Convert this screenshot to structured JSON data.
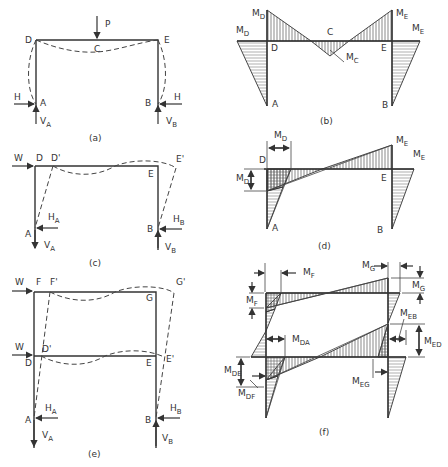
{
  "figure": {
    "panels": [
      {
        "id": "a",
        "caption": "(a)",
        "description": "Portal frame with vertical point load P at mid-span C, fixed bases A and B with horizontal reactions H and vertical reactions VA, VB; dashed deflected shape",
        "labels": {
          "D": "D",
          "E": "E",
          "C": "C",
          "A": "A",
          "B": "B",
          "P": "P",
          "H_left": "H",
          "H_right": "H",
          "VA": "V",
          "VA_sub": "A",
          "VB": "V",
          "VB_sub": "B"
        }
      },
      {
        "id": "b",
        "caption": "(b)",
        "description": "Bending moment diagram for panel (a)",
        "labels": {
          "MD_top": "M",
          "MD_top_sub": "D",
          "MD_left": "M",
          "MD_left_sub": "D",
          "ME_top": "M",
          "ME_top_sub": "E",
          "ME_right": "M",
          "ME_right_sub": "E",
          "C": "C",
          "MC": "M",
          "MC_sub": "C",
          "D": "D",
          "E": "E",
          "A": "A",
          "B": "B"
        }
      },
      {
        "id": "c",
        "caption": "(c)",
        "description": "Portal frame under lateral load W at D; sway deflection to D', E'",
        "labels": {
          "W": "W",
          "D": "D",
          "D_prime": "D'",
          "E": "E",
          "E_prime": "E'",
          "A": "A",
          "B": "B",
          "HA": "H",
          "HA_sub": "A",
          "HB": "H",
          "HB_sub": "B",
          "VA": "V",
          "VA_sub": "A",
          "VB": "V",
          "VB_sub": "B"
        }
      },
      {
        "id": "d",
        "caption": "(d)",
        "description": "Bending moment diagram for panel (c)",
        "labels": {
          "MD_top": "M",
          "MD_top_sub": "D",
          "MD_left": "M",
          "MD_left_sub": "D",
          "ME_top": "M",
          "ME_top_sub": "E",
          "ME_right": "M",
          "ME_right_sub": "E",
          "D": "D",
          "E": "E",
          "A": "A",
          "B": "B"
        }
      },
      {
        "id": "e",
        "caption": "(e)",
        "description": "Two-storey frame with lateral loads W at F and D; sway deflections F', G', D', E'",
        "labels": {
          "W_top": "W",
          "W_mid": "W",
          "F": "F",
          "F_prime": "F'",
          "G": "G",
          "G_prime": "G'",
          "D": "D",
          "D_prime": "D'",
          "E": "E",
          "E_prime": "E'",
          "A": "A",
          "B": "B",
          "HA": "H",
          "HA_sub": "A",
          "HB": "H",
          "HB_sub": "B",
          "VA": "V",
          "VA_sub": "A",
          "VB": "V",
          "VB_sub": "B"
        }
      },
      {
        "id": "f",
        "caption": "(f)",
        "description": "Bending moment diagram for panel (e)",
        "labels": {
          "MF_top": "M",
          "MF_top_sub": "F",
          "MF_left": "M",
          "MF_left_sub": "F",
          "MG_top": "M",
          "MG_top_sub": "G",
          "MG_right": "M",
          "MG_right_sub": "G",
          "MDA": "M",
          "MDA_sub": "DA",
          "MDE": "M",
          "MDE_sub": "DE",
          "MDF": "M",
          "MDF_sub": "DF",
          "MEB": "M",
          "MEB_sub": "EB",
          "MED": "M",
          "MED_sub": "ED",
          "MEG": "M",
          "MEG_sub": "EG"
        }
      }
    ]
  },
  "colors": {
    "line": "#333333",
    "background": "#ffffff"
  }
}
